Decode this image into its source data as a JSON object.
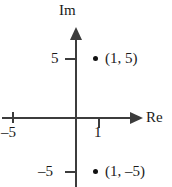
{
  "chart_data": {
    "type": "scatter",
    "title": "",
    "xlabel": "Re",
    "ylabel": "Im",
    "grid": false,
    "legend": null,
    "xlim": [
      -7,
      3
    ],
    "ylim": [
      -7,
      7
    ],
    "x_ticks": [
      {
        "value": -5,
        "label": "–5"
      },
      {
        "value": 1,
        "label": "1"
      }
    ],
    "y_ticks": [
      {
        "value": 5,
        "label": "5"
      },
      {
        "value": -5,
        "label": "–5"
      }
    ],
    "points": [
      {
        "x": 1,
        "y": 5,
        "label": "(1, 5)",
        "marker": "filled-circle"
      },
      {
        "x": 1,
        "y": -5,
        "label": "(1, –5)",
        "marker": "filled-circle"
      }
    ],
    "axis_style": "arrow-terminated",
    "colors": {
      "axis": "#3c3c3c",
      "marker": "#111111",
      "text": "#1a1a1a",
      "background": "#ffffff"
    }
  },
  "axes": {
    "real_label": "Re",
    "imaginary_label": "Im"
  },
  "tick_labels": {
    "re_negative_five": "–5",
    "re_one": "1",
    "im_five": "5",
    "im_negative_five": "–5"
  },
  "point_labels": {
    "upper": "(1, 5)",
    "lower": "(1, –5)"
  }
}
